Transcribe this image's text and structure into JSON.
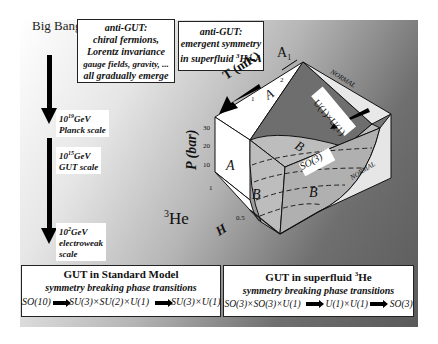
{
  "timeline": {
    "start_label": "Big Bang",
    "scales": [
      {
        "energy_base": "10",
        "energy_exp": "19",
        "unit": "GeV",
        "name": "Planck scale"
      },
      {
        "energy_base": "10",
        "energy_exp": "15",
        "unit": "GeV",
        "name": "GUT scale"
      },
      {
        "energy_base": "10",
        "energy_exp": "2",
        "unit": "GeV",
        "name": "electroweak",
        "name2": "scale"
      }
    ]
  },
  "anti_gut_box_1": {
    "lines": [
      "anti-GUT:",
      "chiral fermions,",
      "Lorentz invariance",
      "gauge fields, gravity, ...",
      "all gradually emerge"
    ]
  },
  "anti_gut_box_2": {
    "lines": [
      "anti-GUT:",
      "emergent symmetry"
    ],
    "line3_prefix": "in superfluid ",
    "line3_sup": "3",
    "line3_suffix": "He-A"
  },
  "phase_diagram": {
    "substance_base": "He",
    "substance_sup": "3",
    "axis_T": "T (mK)",
    "axis_P": "P (bar)",
    "axis_H": "H",
    "T_ticks": [
      "1",
      "2"
    ],
    "P_ticks": [
      "30",
      "20",
      "10",
      "1"
    ],
    "H_tick": "0.5",
    "A1_label": "A",
    "A1_sub": "1",
    "phases": {
      "A": "A",
      "B": "B",
      "normal": "NORMAL"
    },
    "symmetry_labels": {
      "u1u1": "U(1)×U(1)",
      "so3": "SO(3)"
    },
    "colors": {
      "A_face": "#ffffff",
      "B_face": "#c8c8c8",
      "A1_top": "#6e6e6e",
      "normal_face": "#e8e8e8",
      "edge": "#111111"
    }
  },
  "bottom_left": {
    "title": "GUT in Standard Model",
    "subtitle": "symmetry breaking phase transitions",
    "chain": [
      "SO(10)",
      "SU(3)×SU(2)×U(1)",
      "SU(3)×U(1)"
    ]
  },
  "bottom_right": {
    "title_prefix": "GUT  in superfluid ",
    "title_sup": "3",
    "title_suffix": "He",
    "subtitle": "symmetry breaking phase transitions",
    "chain": [
      "SO(3)×SO(3)×U(1)",
      "U(1)×U(1)",
      "SO(3)"
    ]
  }
}
